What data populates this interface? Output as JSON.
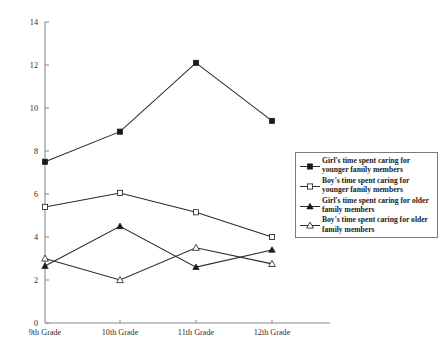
{
  "chart_data": {
    "type": "line",
    "title": "",
    "xlabel": "",
    "ylabel": "",
    "categories": [
      "9th Grade",
      "10th Grade",
      "11th Grade",
      "12th Grade"
    ],
    "ylim": [
      0,
      14
    ],
    "y_ticks": [
      "0",
      "2",
      "4",
      "6",
      "8",
      "10",
      "12",
      "14"
    ],
    "y_tick_values": [
      0,
      2,
      4,
      6,
      8,
      10,
      12,
      14
    ],
    "grid": false,
    "legend_position": "right",
    "series": [
      {
        "name": "Girl's time spent caring for younger family members",
        "marker": "filled-square",
        "values": [
          7.5,
          8.9,
          12.1,
          9.4
        ]
      },
      {
        "name": "Boy's time spent caring for younger family members",
        "marker": "open-square",
        "values": [
          5.4,
          6.05,
          5.15,
          4.0
        ]
      },
      {
        "name": "Girl's time spent caring for older family members",
        "marker": "filled-triangle",
        "values": [
          2.65,
          4.5,
          2.6,
          3.4
        ]
      },
      {
        "name": "Boy's time spent caring for older family members",
        "marker": "open-triangle",
        "values": [
          3.0,
          2.0,
          3.5,
          2.75
        ]
      }
    ]
  },
  "legend": {
    "items": [
      {
        "label": "Girl's time spent caring for younger family members",
        "marker": "filled-square"
      },
      {
        "label": "Boy's time spent caring for younger family members",
        "marker": "open-square"
      },
      {
        "label": "Girl's time spent caring for older family members",
        "marker": "filled-triangle"
      },
      {
        "label": "Boy's time spent caring for older family members",
        "marker": "open-triangle"
      }
    ]
  },
  "axes": {
    "y_labels": [
      "14",
      "12",
      "10",
      "8",
      "6",
      "4",
      "2",
      "0"
    ],
    "x_labels": [
      "9th Grade",
      "10th Grade",
      "11th Grade",
      "12th Grade"
    ]
  }
}
